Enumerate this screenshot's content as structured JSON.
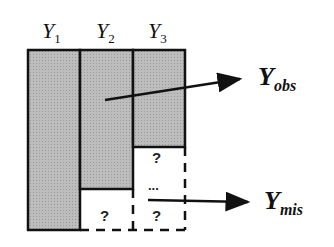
{
  "columns": [
    {
      "name": "Y",
      "sub": "1"
    },
    {
      "name": "Y",
      "sub": "2"
    },
    {
      "name": "Y",
      "sub": "3"
    }
  ],
  "missing": {
    "q1": "?",
    "q2": "?",
    "q3": "?",
    "ellipsis": "..."
  },
  "labels": {
    "obs": {
      "main": "Y",
      "sub": "obs"
    },
    "mis": {
      "main": "Y",
      "sub": "mis"
    }
  },
  "colors": {
    "observed_fill": "#b3b3b3",
    "stroke": "#111111"
  }
}
